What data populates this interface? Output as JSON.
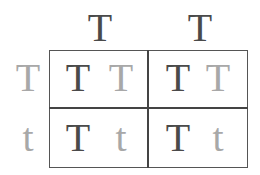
{
  "punnett_square": {
    "columns": [
      "T",
      "T"
    ],
    "rows": [
      "T",
      "t"
    ],
    "cells": [
      [
        {
          "a": "T",
          "b": "T"
        },
        {
          "a": "T",
          "b": "T"
        }
      ],
      [
        {
          "a": "T",
          "b": "t"
        },
        {
          "a": "T",
          "b": "t"
        }
      ]
    ],
    "colors": {
      "dominant_parent": "#4a4a4a",
      "other_parent": "#a8a8a8",
      "grid": "#444444"
    }
  }
}
